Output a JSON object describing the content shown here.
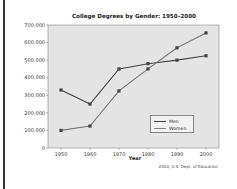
{
  "chart_data": {
    "type": "line",
    "title": "College Degrees by Gender: 1950–2000",
    "xlabel": "Year",
    "ylabel": "",
    "x": [
      1950,
      1960,
      1970,
      1980,
      1990,
      2000
    ],
    "ylim": [
      0,
      700000
    ],
    "yticks": [
      "0",
      "100,000",
      "200,000",
      "300,000",
      "400,000",
      "500,000",
      "600,000",
      "700,000"
    ],
    "xticks": [
      "1950",
      "1960",
      "1970",
      "1980",
      "1990",
      "2000"
    ],
    "series": [
      {
        "name": "Men",
        "color": "#555555",
        "values": [
          330000,
          250000,
          450000,
          480000,
          500000,
          525000
        ]
      },
      {
        "name": "Women",
        "color": "#777777",
        "values": [
          100000,
          125000,
          325000,
          450000,
          570000,
          655000
        ]
      }
    ],
    "grid": false,
    "legend_position": "lower right inside",
    "source": "2000, U.S. Dept. of Education"
  },
  "legend": {
    "men": "Men",
    "women": "Women"
  }
}
